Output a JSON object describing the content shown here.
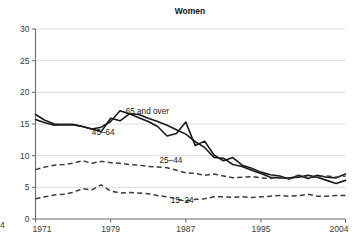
{
  "chart_data": {
    "type": "line",
    "title": "Women",
    "xlabel": "",
    "ylabel": "",
    "xlim": [
      1971,
      2004
    ],
    "ylim": [
      0,
      30
    ],
    "grid": true,
    "legend_position": "inline-labels",
    "x_tick_labels": [
      "1971",
      "1979",
      "1987",
      "1995",
      "2004"
    ],
    "x_tick_values": [
      1971,
      1979,
      1987,
      1995,
      2004
    ],
    "y_tick_labels": [
      "0",
      "5",
      "10",
      "15",
      "20",
      "25",
      "30"
    ],
    "y_tick_values": [
      0,
      5,
      10,
      15,
      20,
      25,
      30
    ],
    "x": [
      1971,
      1972,
      1973,
      1974,
      1975,
      1976,
      1977,
      1978,
      1979,
      1980,
      1981,
      1982,
      1983,
      1984,
      1985,
      1986,
      1987,
      1988,
      1989,
      1990,
      1991,
      1992,
      1993,
      1994,
      1995,
      1996,
      1997,
      1998,
      1999,
      2000,
      2001,
      2002,
      2003,
      2004
    ],
    "series": [
      {
        "name": "65 and over",
        "label": "65 and over",
        "style": "solid",
        "color": "#1a1a1a",
        "label_x": 1980.6,
        "label_y": 16.6,
        "values": [
          15.7,
          15.2,
          14.8,
          14.9,
          14.9,
          14.6,
          14.2,
          14.5,
          15.4,
          17.1,
          16.6,
          16.5,
          15.9,
          15.4,
          14.8,
          14.1,
          13.4,
          12.2,
          11.3,
          9.7,
          9.6,
          8.6,
          8.3,
          7.7,
          7.2,
          6.6,
          6.5,
          6.5,
          6.6,
          6.9,
          6.6,
          6.1,
          5.6,
          6.1
        ]
      },
      {
        "name": "45-64",
        "label": "45–64",
        "style": "solid",
        "color": "#1a1a1a",
        "label_x": 1977.0,
        "label_y": 13.2,
        "values": [
          16.5,
          15.6,
          15.0,
          14.9,
          14.9,
          14.6,
          14.2,
          13.8,
          15.9,
          15.5,
          16.6,
          16.0,
          15.4,
          14.6,
          13.1,
          13.5,
          15.3,
          11.6,
          12.3,
          10.1,
          9.2,
          9.7,
          8.5,
          8.0,
          7.4,
          7.0,
          6.8,
          6.3,
          6.9,
          6.4,
          6.9,
          6.6,
          6.5,
          7.1
        ]
      },
      {
        "name": "25-44",
        "label": "25–44",
        "style": "dashed",
        "color": "#3b3b3b",
        "label_x": 1984.2,
        "label_y": 8.8,
        "values": [
          7.8,
          8.2,
          8.5,
          8.6,
          8.8,
          9.2,
          8.8,
          9.1,
          8.9,
          8.8,
          8.6,
          8.5,
          8.3,
          8.2,
          8.1,
          7.7,
          7.3,
          7.2,
          6.9,
          7.1,
          6.8,
          6.5,
          6.6,
          6.7,
          6.5,
          6.4,
          6.6,
          6.4,
          6.8,
          6.6,
          6.6,
          6.8,
          6.6,
          6.8
        ]
      },
      {
        "name": "15-24",
        "label": "15–24",
        "style": "dashed",
        "color": "#3b3b3b",
        "label_x": 1985.4,
        "label_y": 2.6,
        "values": [
          3.2,
          3.5,
          3.8,
          3.9,
          4.2,
          4.8,
          4.6,
          5.4,
          4.4,
          4.1,
          4.2,
          4.1,
          4.0,
          3.7,
          3.5,
          3.2,
          2.8,
          3.1,
          3.2,
          3.5,
          3.5,
          3.4,
          3.5,
          3.4,
          3.5,
          3.6,
          3.7,
          3.6,
          3.7,
          3.9,
          3.6,
          3.6,
          3.7,
          3.7
        ]
      }
    ],
    "edge_partial_label": "4"
  }
}
